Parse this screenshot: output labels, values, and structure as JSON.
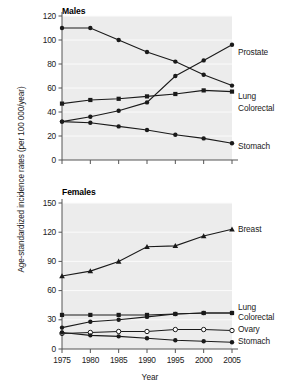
{
  "figure": {
    "y_axis_title": "Age-standardized incidence rates (per 100 000/year)",
    "x_axis_title": "Year"
  },
  "chart_data": [
    {
      "type": "line",
      "title": "Males",
      "xlabel": "Year",
      "ylabel": "Age-standardized incidence rates (per 100 000/year)",
      "x": [
        1975,
        1980,
        1985,
        1990,
        1995,
        2000,
        2005
      ],
      "xticklabels": [
        "1975",
        "1980",
        "1985",
        "1990",
        "1995",
        "2000",
        "2005"
      ],
      "yticks": [
        0,
        20,
        40,
        60,
        80,
        100,
        120
      ],
      "yticklabels": [
        "0",
        "20",
        "40",
        "60",
        "80",
        "100",
        "120"
      ],
      "ylim": [
        0,
        120
      ],
      "xlim": [
        1975,
        2005
      ],
      "grid": true,
      "legend_position": "right-inline",
      "series": [
        {
          "name": "Prostate",
          "marker": "circle-filled",
          "values": [
            32,
            36,
            41,
            48,
            70,
            83,
            96
          ]
        },
        {
          "name": "Lung",
          "marker": "circle-filled",
          "values": [
            110,
            110,
            100,
            90,
            82,
            71,
            62
          ]
        },
        {
          "name": "Colorectal",
          "marker": "square-filled",
          "values": [
            47,
            50,
            51,
            53,
            55,
            58,
            57
          ]
        },
        {
          "name": "Stomach",
          "marker": "circle-filled",
          "values": [
            32,
            31,
            28,
            25,
            21,
            18,
            14
          ]
        }
      ]
    },
    {
      "type": "line",
      "title": "Females",
      "xlabel": "Year",
      "ylabel": "Age-standardized incidence rates (per 100 000/year)",
      "x": [
        1975,
        1980,
        1985,
        1990,
        1995,
        2000,
        2005
      ],
      "xticklabels": [
        "1975",
        "1980",
        "1985",
        "1990",
        "1995",
        "2000",
        "2005"
      ],
      "yticks": [
        0,
        30,
        60,
        90,
        120,
        150
      ],
      "yticklabels": [
        "0",
        "30",
        "60",
        "90",
        "120",
        "150"
      ],
      "ylim": [
        0,
        150
      ],
      "xlim": [
        1975,
        2005
      ],
      "grid": true,
      "legend_position": "right-inline",
      "series": [
        {
          "name": "Breast",
          "marker": "triangle-filled",
          "values": [
            75,
            80,
            90,
            105,
            106,
            116,
            123
          ]
        },
        {
          "name": "Lung",
          "marker": "square-filled",
          "values": [
            35,
            35,
            35,
            35,
            36,
            37,
            37
          ]
        },
        {
          "name": "Colorectal",
          "marker": "circle-filled",
          "values": [
            22,
            28,
            30,
            33,
            36,
            37,
            37
          ]
        },
        {
          "name": "Ovary",
          "marker": "circle-open",
          "values": [
            16,
            17,
            18,
            18,
            20,
            20,
            19
          ]
        },
        {
          "name": "Stomach",
          "marker": "circle-filled",
          "values": [
            17,
            14,
            13,
            11,
            9,
            8,
            7
          ]
        }
      ]
    }
  ],
  "panels": {
    "males": {
      "title": "Males",
      "labels": [
        "Prostate",
        "Lung",
        "Colorectal",
        "Stomach"
      ]
    },
    "females": {
      "title": "Females",
      "labels": [
        "Breast",
        "Lung",
        "Colorectal",
        "Ovary",
        "Stomach"
      ]
    }
  },
  "colors": {
    "plot_background": "#ececec",
    "gridline": "#f8f8f8",
    "line": "#1a1a1a",
    "axis": "#555555",
    "text": "#1a1a1a"
  }
}
